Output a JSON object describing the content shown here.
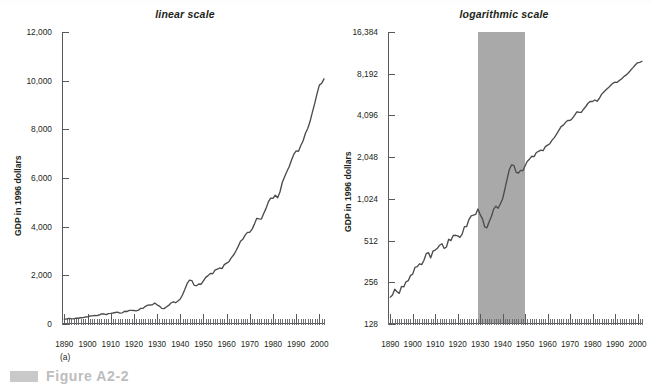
{
  "figure": {
    "caption_label": "Figure A2-2",
    "caption_bar": "gray-bar-marker"
  },
  "panels": [
    {
      "id": "a",
      "sublabel": "(a)",
      "title": "linear scale",
      "ylabel": "GDP in 1996 dollars"
    },
    {
      "id": "b",
      "sublabel": "(b)",
      "title": "logarithmic scale",
      "ylabel": "GDP in 1996 dollars"
    }
  ],
  "colors": {
    "curve": "#4c4c4f",
    "axis": "#58595b",
    "band": "#a9a9a9",
    "caption": "#bdbdbd",
    "text": "#231f20"
  },
  "chart_data": [
    {
      "type": "line",
      "title": "linear scale",
      "panel": "(a)",
      "xlabel": "",
      "ylabel": "GDP in 1996 dollars",
      "yscale": "linear",
      "ylim": [
        0,
        12000
      ],
      "yticks": [
        0,
        2000,
        4000,
        6000,
        8000,
        10000,
        12000
      ],
      "ytick_labels": [
        "0",
        "2,000",
        "4,000",
        "6,000",
        "8,000",
        "10,000",
        "12,000"
      ],
      "xlim": [
        1889,
        2002
      ],
      "xticks": [
        1890,
        1900,
        1910,
        1920,
        1930,
        1940,
        1950,
        1960,
        1970,
        1980,
        1990,
        2000
      ],
      "xtick_labels": [
        "1890",
        "1900",
        "1910",
        "1920",
        "1930",
        "1940",
        "1950",
        "1960",
        "1970",
        "1980",
        "1990",
        "2000"
      ],
      "minor_tick_interval": 1,
      "grid": false,
      "legend": null,
      "series": [
        {
          "name": "Real GDP (billions of 1996 dollars)",
          "x": [
            1890,
            1891,
            1892,
            1893,
            1894,
            1895,
            1896,
            1897,
            1898,
            1899,
            1900,
            1901,
            1902,
            1903,
            1904,
            1905,
            1906,
            1907,
            1908,
            1909,
            1910,
            1911,
            1912,
            1913,
            1914,
            1915,
            1916,
            1917,
            1918,
            1919,
            1920,
            1921,
            1922,
            1923,
            1924,
            1925,
            1926,
            1927,
            1928,
            1929,
            1930,
            1931,
            1932,
            1933,
            1934,
            1935,
            1936,
            1937,
            1938,
            1939,
            1940,
            1941,
            1942,
            1943,
            1944,
            1945,
            1946,
            1947,
            1948,
            1949,
            1950,
            1951,
            1952,
            1953,
            1954,
            1955,
            1956,
            1957,
            1958,
            1959,
            1960,
            1961,
            1962,
            1963,
            1964,
            1965,
            1966,
            1967,
            1968,
            1969,
            1970,
            1971,
            1972,
            1973,
            1974,
            1975,
            1976,
            1977,
            1978,
            1979,
            1980,
            1981,
            1982,
            1983,
            1984,
            1985,
            1986,
            1987,
            1988,
            1989,
            1990,
            1991,
            1992,
            1993,
            1994,
            1995,
            1996,
            1997,
            1998,
            1999,
            2000,
            2001,
            2002
          ],
          "y": [
            200,
            207,
            228,
            219,
            213,
            239,
            237,
            258,
            263,
            286,
            294,
            328,
            332,
            348,
            343,
            369,
            412,
            419,
            384,
            429,
            437,
            451,
            474,
            486,
            449,
            460,
            523,
            512,
            557,
            559,
            554,
            540,
            570,
            645,
            647,
            726,
            773,
            781,
            790,
            865,
            789,
            738,
            642,
            633,
            701,
            764,
            863,
            907,
            875,
            945,
            1026,
            1203,
            1426,
            1669,
            1803,
            1786,
            1589,
            1574,
            1643,
            1635,
            1777,
            1915,
            1988,
            2079,
            2065,
            2213,
            2256,
            2301,
            2279,
            2441,
            2502,
            2560,
            2715,
            2834,
            2999,
            3191,
            3399,
            3485,
            3653,
            3765,
            3772,
            3899,
            4105,
            4342,
            4320,
            4311,
            4541,
            4751,
            5015,
            5173,
            5162,
            5292,
            5189,
            5424,
            5814,
            6054,
            6264,
            6475,
            6743,
            6981,
            7113,
            7101,
            7337,
            7533,
            7836,
            8032,
            8329,
            8704,
            9067,
            9470,
            9817,
            9891,
            10075
          ],
          "units": "billions of 1996 dollars"
        }
      ]
    },
    {
      "type": "line",
      "title": "logarithmic scale",
      "panel": "(b)",
      "xlabel": "",
      "ylabel": "GDP in 1996 dollars",
      "yscale": "log2",
      "ylim": [
        128,
        16384
      ],
      "yticks": [
        128,
        256,
        512,
        1024,
        2048,
        4096,
        8192,
        16384
      ],
      "ytick_labels": [
        "128",
        "256",
        "512",
        "1,024",
        "2,048",
        "4,096",
        "8,192",
        "16,384"
      ],
      "xlim": [
        1889,
        2002
      ],
      "xticks": [
        1890,
        1900,
        1910,
        1920,
        1930,
        1940,
        1950,
        1960,
        1970,
        1980,
        1990,
        2000
      ],
      "xtick_labels": [
        "1890",
        "1900",
        "1910",
        "1920",
        "1930",
        "1940",
        "1950",
        "1960",
        "1970",
        "1980",
        "1990",
        "2000"
      ],
      "minor_tick_interval": 1,
      "grid": false,
      "legend": null,
      "annotations": [
        {
          "kind": "shaded-band",
          "x_start": 1929,
          "x_end": 1950,
          "color": "#a9a9a9"
        }
      ],
      "series": [
        {
          "name": "Real GDP (billions of 1996 dollars)",
          "x": [
            1890,
            1891,
            1892,
            1893,
            1894,
            1895,
            1896,
            1897,
            1898,
            1899,
            1900,
            1901,
            1902,
            1903,
            1904,
            1905,
            1906,
            1907,
            1908,
            1909,
            1910,
            1911,
            1912,
            1913,
            1914,
            1915,
            1916,
            1917,
            1918,
            1919,
            1920,
            1921,
            1922,
            1923,
            1924,
            1925,
            1926,
            1927,
            1928,
            1929,
            1930,
            1931,
            1932,
            1933,
            1934,
            1935,
            1936,
            1937,
            1938,
            1939,
            1940,
            1941,
            1942,
            1943,
            1944,
            1945,
            1946,
            1947,
            1948,
            1949,
            1950,
            1951,
            1952,
            1953,
            1954,
            1955,
            1956,
            1957,
            1958,
            1959,
            1960,
            1961,
            1962,
            1963,
            1964,
            1965,
            1966,
            1967,
            1968,
            1969,
            1970,
            1971,
            1972,
            1973,
            1974,
            1975,
            1976,
            1977,
            1978,
            1979,
            1980,
            1981,
            1982,
            1983,
            1984,
            1985,
            1986,
            1987,
            1988,
            1989,
            1990,
            1991,
            1992,
            1993,
            1994,
            1995,
            1996,
            1997,
            1998,
            1999,
            2000,
            2001,
            2002
          ],
          "y": [
            200,
            207,
            228,
            219,
            213,
            239,
            237,
            258,
            263,
            286,
            294,
            328,
            332,
            348,
            343,
            369,
            412,
            419,
            384,
            429,
            437,
            451,
            474,
            486,
            449,
            460,
            523,
            512,
            557,
            559,
            554,
            540,
            570,
            645,
            647,
            726,
            773,
            781,
            790,
            865,
            789,
            738,
            642,
            633,
            701,
            764,
            863,
            907,
            875,
            945,
            1026,
            1203,
            1426,
            1669,
            1803,
            1786,
            1589,
            1574,
            1643,
            1635,
            1777,
            1915,
            1988,
            2079,
            2065,
            2213,
            2256,
            2301,
            2279,
            2441,
            2502,
            2560,
            2715,
            2834,
            2999,
            3191,
            3399,
            3485,
            3653,
            3765,
            3772,
            3899,
            4105,
            4342,
            4320,
            4311,
            4541,
            4751,
            5015,
            5173,
            5162,
            5292,
            5189,
            5424,
            5814,
            6054,
            6264,
            6475,
            6743,
            6981,
            7113,
            7101,
            7337,
            7533,
            7836,
            8032,
            8329,
            8704,
            9067,
            9470,
            9817,
            9891,
            10075
          ],
          "units": "billions of 1996 dollars"
        }
      ]
    }
  ]
}
